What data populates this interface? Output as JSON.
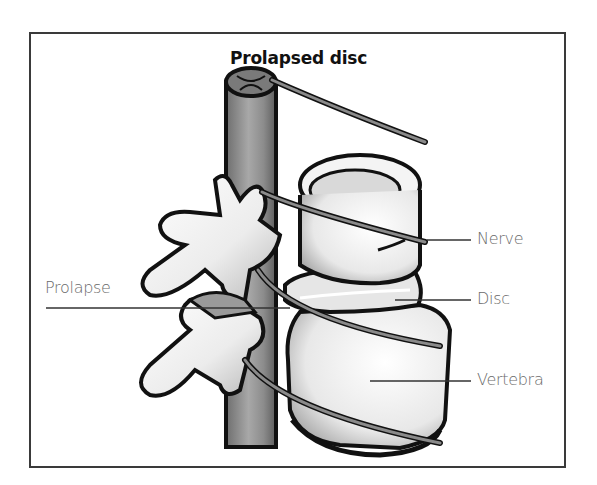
{
  "figure": {
    "title": "Prolapsed disc",
    "labels": {
      "nerve": "Nerve",
      "disc": "Disc",
      "vertebra": "Vertebra",
      "prolapse": "Prolapse"
    },
    "colors": {
      "outline": "#111111",
      "cord": "#8a8a8a",
      "bone": "#f2f2f2",
      "shade": "#bdbdbd",
      "label_text": "#6a6a6a",
      "frame": "#3a3a3a"
    }
  }
}
